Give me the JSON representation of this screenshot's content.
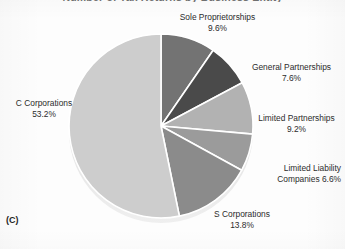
{
  "figure": {
    "caption": "(C)",
    "clipped_title": "Number of Tax Returns by Business Entity"
  },
  "chart_data": {
    "type": "pie",
    "title": "",
    "xlabel": "",
    "ylabel": "",
    "legend_position": "none",
    "grid": false,
    "start_angle_deg": 0,
    "direction": "clockwise",
    "units": "percent",
    "categories": [
      "Sole Proprietorships",
      "General Partnerships",
      "Limited Partnerships",
      "Limited Liability Companies",
      "S Corporations",
      "C Corporations"
    ],
    "values": [
      9.6,
      7.6,
      9.2,
      6.6,
      13.8,
      53.2
    ],
    "colors": [
      "#737373",
      "#4a4a4a",
      "#b2b2b2",
      "#9b9b9b",
      "#8b8b8b",
      "#cdcdcd"
    ],
    "slices": [
      {
        "label": "Sole Proprietorships",
        "value": 9.6,
        "value_text": "9.6%",
        "color": "#737373"
      },
      {
        "label": "General Partnerships",
        "value": 7.6,
        "value_text": "7.6%",
        "color": "#4a4a4a"
      },
      {
        "label": "Limited Partnerships",
        "value": 9.2,
        "value_text": "9.2%",
        "color": "#b2b2b2"
      },
      {
        "label": "Limited Liability Companies",
        "value": 6.6,
        "value_text": "6.6%",
        "color": "#9b9b9b"
      },
      {
        "label": "S Corporations",
        "value": 13.8,
        "value_text": "13.8%",
        "color": "#8b8b8b"
      },
      {
        "label": "C Corporations",
        "value": 53.2,
        "value_text": "53.2%",
        "color": "#cdcdcd"
      }
    ]
  },
  "labels": {
    "sole_proprietorships": {
      "name": "Sole Proprietorships",
      "pct": "9.6%"
    },
    "general_partnerships": {
      "name": "General Partnerships",
      "pct": "7.6%"
    },
    "limited_partnerships": {
      "name": "Limited Partnerships",
      "pct": "9.2%"
    },
    "limited_liability": {
      "line1": "Limited Liability",
      "line2": "Companies 6.6%"
    },
    "s_corporations": {
      "name": "S Corporations",
      "pct": "13.8%"
    },
    "c_corporations": {
      "name": "C Corporations",
      "pct": "53.2%"
    }
  }
}
